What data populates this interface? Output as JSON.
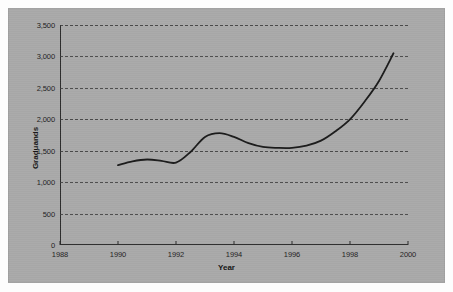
{
  "figure": {
    "background_color": "#a9a9a9",
    "page_color": "#fdfdfd",
    "line_color": "#1a1a1a",
    "grid_color": "#3a3a3a",
    "axis_color": "#2b2b2b"
  },
  "chart_data": {
    "type": "line",
    "title": "",
    "xlabel": "Year",
    "ylabel": "Graduands",
    "xlim": [
      1988,
      2000
    ],
    "ylim": [
      0,
      3500
    ],
    "grid": true,
    "legend": "none",
    "x_ticks": [
      "1988",
      "1990",
      "1992",
      "1994",
      "1996",
      "1998",
      "2000"
    ],
    "x_tick_values": [
      1988,
      1990,
      1992,
      1994,
      1996,
      1998,
      2000
    ],
    "y_ticks": [
      "0",
      "500",
      "1,000",
      "1,500",
      "2,000",
      "2,500",
      "3,000",
      "3,500"
    ],
    "y_tick_values": [
      0,
      500,
      1000,
      1500,
      2000,
      2500,
      3000,
      3500
    ],
    "series": [
      {
        "name": "Graduands",
        "x": [
          1990,
          1990.5,
          1991,
          1991.5,
          1992,
          1992.5,
          1993,
          1993.5,
          1994,
          1994.5,
          1995,
          1995.5,
          1996,
          1996.5,
          1997,
          1997.5,
          1998,
          1998.5,
          1999,
          1999.5
        ],
        "values": [
          1270,
          1330,
          1360,
          1340,
          1310,
          1480,
          1720,
          1780,
          1720,
          1620,
          1560,
          1545,
          1545,
          1580,
          1660,
          1810,
          2000,
          2280,
          2610,
          3050
        ]
      }
    ]
  }
}
